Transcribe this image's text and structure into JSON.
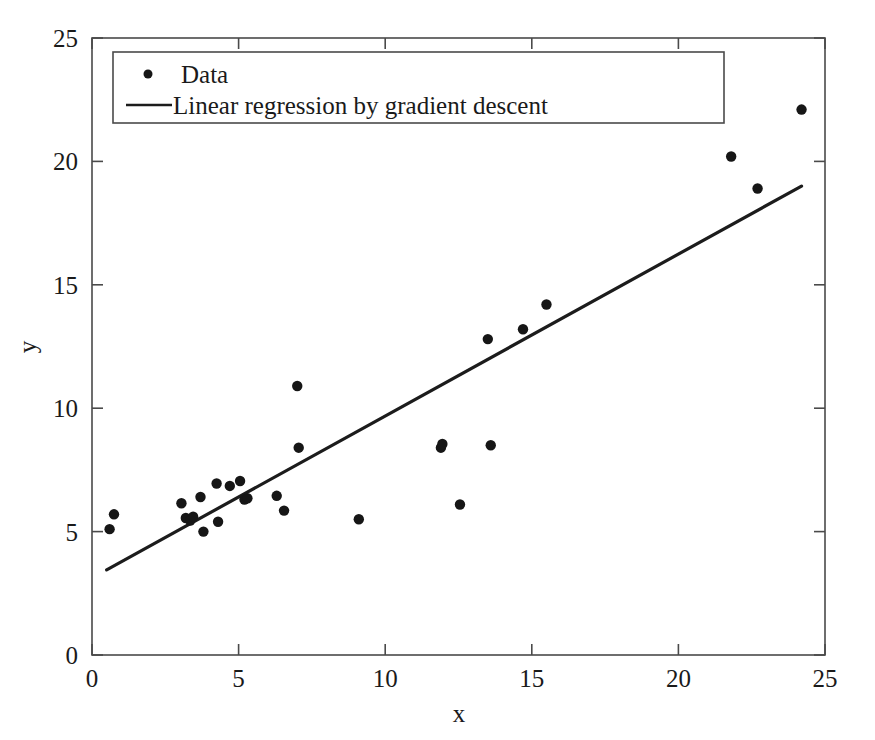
{
  "chart_data": {
    "type": "scatter",
    "title": "",
    "xlabel": "x",
    "ylabel": "y",
    "xlim": [
      0,
      25
    ],
    "ylim": [
      0,
      25
    ],
    "xticks": [
      0,
      5,
      10,
      15,
      20,
      25
    ],
    "yticks": [
      0,
      5,
      10,
      15,
      20,
      25
    ],
    "grid": false,
    "legend_position": "upper-left",
    "series": [
      {
        "name": "Data",
        "type": "scatter",
        "marker": "circle",
        "color": "#161616",
        "points": [
          [
            0.6,
            5.1
          ],
          [
            0.75,
            5.7
          ],
          [
            3.05,
            6.15
          ],
          [
            3.2,
            5.55
          ],
          [
            3.35,
            5.45
          ],
          [
            3.45,
            5.6
          ],
          [
            3.7,
            6.4
          ],
          [
            3.8,
            5.0
          ],
          [
            4.25,
            6.95
          ],
          [
            4.3,
            5.4
          ],
          [
            4.7,
            6.85
          ],
          [
            5.05,
            7.05
          ],
          [
            5.2,
            6.3
          ],
          [
            5.3,
            6.35
          ],
          [
            6.3,
            6.45
          ],
          [
            6.55,
            5.85
          ],
          [
            7.0,
            10.9
          ],
          [
            7.05,
            8.4
          ],
          [
            9.1,
            5.5
          ],
          [
            11.9,
            8.4
          ],
          [
            11.95,
            8.55
          ],
          [
            12.55,
            6.1
          ],
          [
            13.6,
            8.5
          ],
          [
            13.5,
            12.8
          ],
          [
            14.7,
            13.2
          ],
          [
            15.5,
            14.2
          ],
          [
            21.8,
            20.2
          ],
          [
            22.7,
            18.9
          ],
          [
            24.2,
            22.1
          ]
        ]
      },
      {
        "name": "Linear regression by gradient descent",
        "type": "line",
        "color": "#1c1c1c",
        "endpoints": [
          [
            0.5,
            3.45
          ],
          [
            24.2,
            19.0
          ]
        ],
        "slope": 0.656,
        "intercept": 3.12
      }
    ],
    "legend_entries": [
      {
        "label": "Data",
        "marker": "dot"
      },
      {
        "label": "Linear regression by gradient descent",
        "marker": "line"
      }
    ]
  },
  "axes": {
    "x_title": "x",
    "y_title": "y",
    "x_tick_labels": [
      "0",
      "5",
      "10",
      "15",
      "20",
      "25"
    ],
    "y_tick_labels": [
      "0",
      "5",
      "10",
      "15",
      "20",
      "25"
    ]
  },
  "legend": {
    "data_label": "Data",
    "regression_label": "Linear regression by gradient descent"
  },
  "colors": {
    "marker": "#161616",
    "line": "#1c1c1c",
    "axis": "#4a4a4a",
    "background": "#ffffff"
  }
}
